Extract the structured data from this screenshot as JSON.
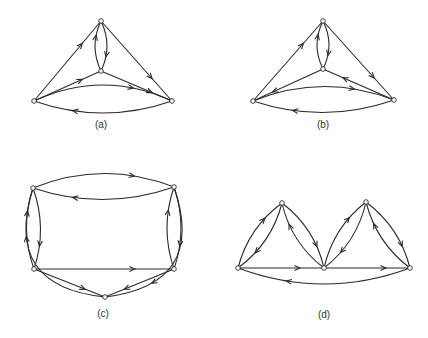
{
  "figure": {
    "panels": [
      {
        "id": "a",
        "label": "(a)",
        "label_pos": [
          101,
          128
        ],
        "nodes": [
          {
            "id": "T",
            "x": 101,
            "y": 21
          },
          {
            "id": "C",
            "x": 101,
            "y": 71
          },
          {
            "id": "L",
            "x": 34,
            "y": 101
          },
          {
            "id": "R",
            "x": 172,
            "y": 101
          }
        ],
        "edges": [
          {
            "from": "L",
            "to": "T",
            "bend": 0
          },
          {
            "from": "T",
            "to": "R",
            "bend": 0
          },
          {
            "from": "C",
            "to": "T",
            "bend": 6
          },
          {
            "from": "T",
            "to": "C",
            "bend": 6
          },
          {
            "from": "L",
            "to": "C",
            "bend": 0
          },
          {
            "from": "C",
            "to": "R",
            "bend": 0
          },
          {
            "from": "R",
            "to": "L",
            "bend": 12
          },
          {
            "from": "L",
            "to": "R",
            "bend": 16
          }
        ]
      },
      {
        "id": "b",
        "label": "(b)",
        "label_pos": [
          323,
          128
        ],
        "nodes": [
          {
            "id": "T",
            "x": 323,
            "y": 21
          },
          {
            "id": "C",
            "x": 323,
            "y": 69
          },
          {
            "id": "L",
            "x": 253,
            "y": 101
          },
          {
            "id": "R",
            "x": 394,
            "y": 100
          }
        ],
        "edges": [
          {
            "from": "L",
            "to": "T",
            "bend": 0
          },
          {
            "from": "T",
            "to": "R",
            "bend": 0
          },
          {
            "from": "C",
            "to": "T",
            "bend": 6
          },
          {
            "from": "T",
            "to": "C",
            "bend": 6
          },
          {
            "from": "C",
            "to": "L",
            "bend": 0
          },
          {
            "from": "R",
            "to": "C",
            "bend": 0
          },
          {
            "from": "R",
            "to": "L",
            "bend": 12
          },
          {
            "from": "L",
            "to": "R",
            "bend": 14
          }
        ]
      },
      {
        "id": "c",
        "label": "(c)",
        "label_pos": [
          103,
          317
        ],
        "nodes": [
          {
            "id": "TL",
            "x": 33,
            "y": 188
          },
          {
            "id": "TR",
            "x": 174,
            "y": 187
          },
          {
            "id": "BL",
            "x": 34,
            "y": 269
          },
          {
            "id": "BR",
            "x": 174,
            "y": 269
          },
          {
            "id": "B",
            "x": 105,
            "y": 297
          }
        ],
        "edges": [
          {
            "from": "TL",
            "to": "TR",
            "bend": 14
          },
          {
            "from": "TR",
            "to": "TL",
            "bend": 12
          },
          {
            "from": "TL",
            "to": "BL",
            "bend": 7
          },
          {
            "from": "BL",
            "to": "TL",
            "bend": 7
          },
          {
            "from": "TR",
            "to": "BR",
            "bend": 7
          },
          {
            "from": "BR",
            "to": "TR",
            "bend": 7
          },
          {
            "from": "BL",
            "to": "BR",
            "bend": 0
          },
          {
            "from": "BL",
            "to": "B",
            "bend": 0
          },
          {
            "from": "BR",
            "to": "B",
            "bend": 0
          },
          {
            "from": "B",
            "to": "TL",
            "bend": 40
          },
          {
            "from": "TR",
            "to": "B",
            "bend": 40
          }
        ]
      },
      {
        "id": "d",
        "label": "(d)",
        "label_pos": [
          324,
          318
        ],
        "nodes": [
          {
            "id": "L",
            "x": 238,
            "y": 268
          },
          {
            "id": "T1",
            "x": 282,
            "y": 203
          },
          {
            "id": "M",
            "x": 324,
            "y": 268
          },
          {
            "id": "T2",
            "x": 366,
            "y": 202
          },
          {
            "id": "R",
            "x": 410,
            "y": 268
          }
        ],
        "edges": [
          {
            "from": "L",
            "to": "T1",
            "bend": 7
          },
          {
            "from": "T1",
            "to": "L",
            "bend": 7
          },
          {
            "from": "T1",
            "to": "M",
            "bend": 7
          },
          {
            "from": "M",
            "to": "T1",
            "bend": 7
          },
          {
            "from": "M",
            "to": "T2",
            "bend": 7
          },
          {
            "from": "T2",
            "to": "M",
            "bend": 7
          },
          {
            "from": "T2",
            "to": "R",
            "bend": 7
          },
          {
            "from": "R",
            "to": "T2",
            "bend": 7
          },
          {
            "from": "L",
            "to": "M",
            "bend": 0
          },
          {
            "from": "M",
            "to": "R",
            "bend": 0
          },
          {
            "from": "R",
            "to": "L",
            "bend": 16
          }
        ]
      }
    ]
  },
  "labels": {
    "a": "(a)",
    "b": "(b)",
    "c": "(c)",
    "d": "(d)"
  }
}
